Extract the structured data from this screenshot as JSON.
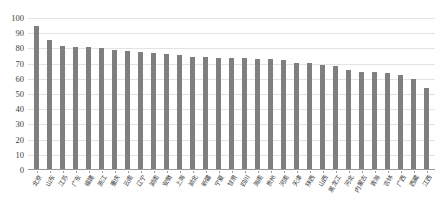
{
  "chart_data": {
    "type": "bar",
    "title": "",
    "subtitle": "",
    "xlabel": "",
    "ylabel": "",
    "ylim": [
      0,
      100
    ],
    "ytick_step": 10,
    "yticks": [
      0,
      10,
      20,
      30,
      40,
      50,
      60,
      70,
      80,
      90,
      100
    ],
    "grid": true,
    "legend": "none",
    "bar_color": "#7f7f7f",
    "gridline_color": "#e3e3e3",
    "axis_color": "#9a9a9a",
    "label_rotation_degrees": -60,
    "categories": [
      "北京",
      "山东",
      "江苏",
      "广东",
      "福建",
      "浙江",
      "重庆",
      "云南",
      "辽宁",
      "湖南",
      "安徽",
      "上海",
      "湖北",
      "新疆",
      "宁夏",
      "甘肃",
      "四川",
      "海南",
      "贵州",
      "河南",
      "天津",
      "陕西",
      "山西",
      "黑龙江",
      "河北",
      "内蒙古",
      "青海",
      "吉林",
      "广西",
      "西藏",
      "江西"
    ],
    "values": [
      94.0,
      85.0,
      81.0,
      80.0,
      80.0,
      79.5,
      78.5,
      77.5,
      77.0,
      76.0,
      75.5,
      75.0,
      73.5,
      73.5,
      73.0,
      73.0,
      73.0,
      72.5,
      72.5,
      71.5,
      70.0,
      69.5,
      68.5,
      68.0,
      65.0,
      64.0,
      64.0,
      63.0,
      62.0,
      59.5,
      53.5
    ],
    "series": [
      {
        "name": "值",
        "values": [
          94.0,
          85.0,
          81.0,
          80.0,
          80.0,
          79.5,
          78.5,
          77.5,
          77.0,
          76.0,
          75.5,
          75.0,
          73.5,
          73.5,
          73.0,
          73.0,
          73.0,
          72.5,
          72.5,
          71.5,
          70.0,
          69.5,
          68.5,
          68.0,
          65.0,
          64.0,
          64.0,
          63.0,
          62.0,
          59.5,
          53.5
        ]
      }
    ]
  }
}
